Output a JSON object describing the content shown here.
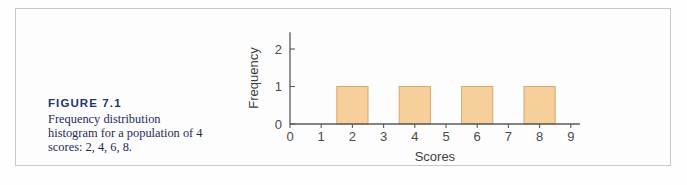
{
  "figure": {
    "number_label": "FIGURE 7.1",
    "caption": "Frequency distribution histogram for a population of 4 scores: 2, 4, 6, 8.",
    "number_color": "#23356b",
    "caption_color": "#1d2a56",
    "frame_color": "#c9c9c9",
    "background": "#fdfdfd"
  },
  "chart_data": {
    "type": "bar",
    "title": "",
    "subtitle": "",
    "xlabel": "Scores",
    "ylabel": "Frequency",
    "categories": [
      2,
      4,
      6,
      8
    ],
    "values": [
      1,
      1,
      1,
      1
    ],
    "bar_width": 1,
    "xlim": [
      0,
      9
    ],
    "ylim": [
      0,
      2.45
    ],
    "x_ticks": [
      0,
      1,
      2,
      3,
      4,
      5,
      6,
      7,
      8,
      9
    ],
    "x_tick_labels": [
      "0",
      "1",
      "2",
      "3",
      "4",
      "5",
      "6",
      "7",
      "8",
      "9"
    ],
    "y_ticks": [
      0,
      1,
      2
    ],
    "y_tick_labels": [
      "0",
      "1",
      "2"
    ],
    "grid": false,
    "legend": null,
    "bar_fill": "#f7cf9b",
    "bar_stroke": "#d8a96d",
    "axis_color": "#5a5a5a",
    "tick_label_color": "#4a4a4a",
    "axis_title_color": "#3d3d3d"
  }
}
